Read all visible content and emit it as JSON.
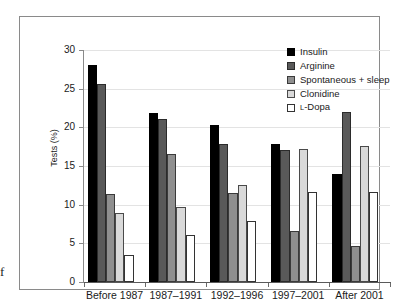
{
  "figure": {
    "caption_fragment": "f"
  },
  "chart_data": {
    "type": "bar",
    "title": "",
    "xlabel": "",
    "ylabel": "Tests (%)",
    "ylim": [
      0,
      30
    ],
    "ytick_step": 5,
    "yticks": [
      "30",
      "25",
      "20",
      "15",
      "10",
      "5",
      "0"
    ],
    "grid": true,
    "legend_position": "top-right",
    "categories": [
      "Before 1987",
      "1987–1991",
      "1992–1996",
      "1997–2001",
      "After 2001"
    ],
    "series": [
      {
        "name": "Insulin",
        "color": "#000000",
        "values": [
          28.0,
          21.9,
          20.3,
          17.8,
          14.0
        ]
      },
      {
        "name": "Arginine",
        "color": "#595959",
        "values": [
          25.6,
          21.1,
          17.9,
          17.1,
          22.0
        ]
      },
      {
        "name": "Spontaneous + sleep",
        "color": "#8f8f8f",
        "values": [
          11.4,
          16.5,
          11.5,
          6.6,
          4.7
        ]
      },
      {
        "name": "Clonidine",
        "color": "#d9d9d9",
        "values": [
          8.9,
          9.7,
          12.5,
          17.2,
          17.6
        ]
      },
      {
        "name": "L-Dopa",
        "color": "#ffffff",
        "values": [
          3.5,
          6.1,
          7.9,
          11.7,
          11.7
        ]
      }
    ]
  }
}
